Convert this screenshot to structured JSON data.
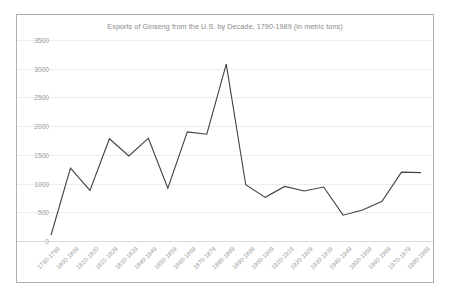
{
  "chart_data": {
    "type": "line",
    "title": "Exports of Ginseng from the U.S. by Decade, 1790-1989 (in metric tons)",
    "xlabel": "",
    "ylabel": "",
    "ylim": [
      0,
      3500
    ],
    "ytick_step": 500,
    "grid": true,
    "legend": "none",
    "line_color": "#404040",
    "categories": [
      "1790-1799",
      "1800-1809",
      "1810-1820",
      "1821-1829",
      "1830-1839",
      "1840-1849",
      "1850-1859",
      "1860-1869",
      "1870-1879",
      "1880-1889",
      "1890-1899",
      "1900-1909",
      "1910-1919",
      "1920-1929",
      "1930-1939",
      "1940-1949",
      "1950-1959",
      "1960-1969",
      "1970-1979",
      "1980-1989"
    ],
    "values": [
      100,
      1270,
      880,
      1780,
      1480,
      1790,
      920,
      1900,
      1860,
      3080,
      980,
      760,
      950,
      870,
      940,
      450,
      540,
      690,
      1200,
      1190
    ],
    "yticks": [
      "0",
      "500",
      "1000",
      "1500",
      "2000",
      "2500",
      "3000",
      "3500"
    ]
  },
  "frame": {
    "border_color": "#b0b0b0",
    "background": "#ffffff"
  }
}
